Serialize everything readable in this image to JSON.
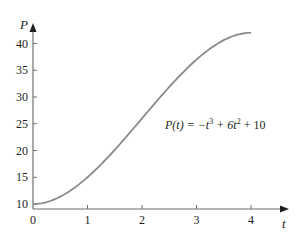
{
  "chart_data": {
    "type": "line",
    "title": "",
    "xlabel": "t",
    "ylabel": "P",
    "xlim": [
      0,
      4.3
    ],
    "ylim": [
      9,
      43
    ],
    "grid": false,
    "legend": null,
    "x_ticks": [
      "0",
      "1",
      "2",
      "3",
      "4"
    ],
    "y_ticks": [
      "10",
      "15",
      "20",
      "25",
      "30",
      "35",
      "40"
    ],
    "annotation": {
      "prefix": "P(t) = −t",
      "exp1": "3",
      "mid": " + 6t",
      "exp2": "2",
      "suffix": " + 10"
    },
    "series": [
      {
        "name": "P(t) = -t^3 + 6t^2 + 10",
        "x": [
          0,
          0.25,
          0.5,
          0.75,
          1,
          1.25,
          1.5,
          1.75,
          2,
          2.25,
          2.5,
          2.75,
          3,
          3.25,
          3.5,
          3.75,
          4
        ],
        "y": [
          10,
          10.36,
          11.38,
          12.95,
          15,
          17.42,
          20.13,
          23.02,
          26,
          28.98,
          31.88,
          34.58,
          37,
          39.05,
          40.63,
          41.66,
          42
        ]
      }
    ],
    "line_color": "#8a8a8a",
    "axis_color": "#6d6e70"
  }
}
